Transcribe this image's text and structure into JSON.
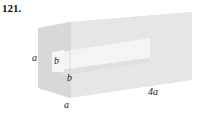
{
  "problem": {
    "number": "121."
  },
  "figure": {
    "type": "rectangular prism with square hole",
    "labels": {
      "front_height": "a",
      "front_width": "a",
      "hole_width": "b",
      "hole_height": "b",
      "length": "4a"
    },
    "colors": {
      "front_face": "#d9d9d9",
      "top_face": "#ececec",
      "side_face": "#e4e4e4",
      "hole_inner": "#f7f7f7",
      "edge": "#c8c8c8"
    }
  }
}
